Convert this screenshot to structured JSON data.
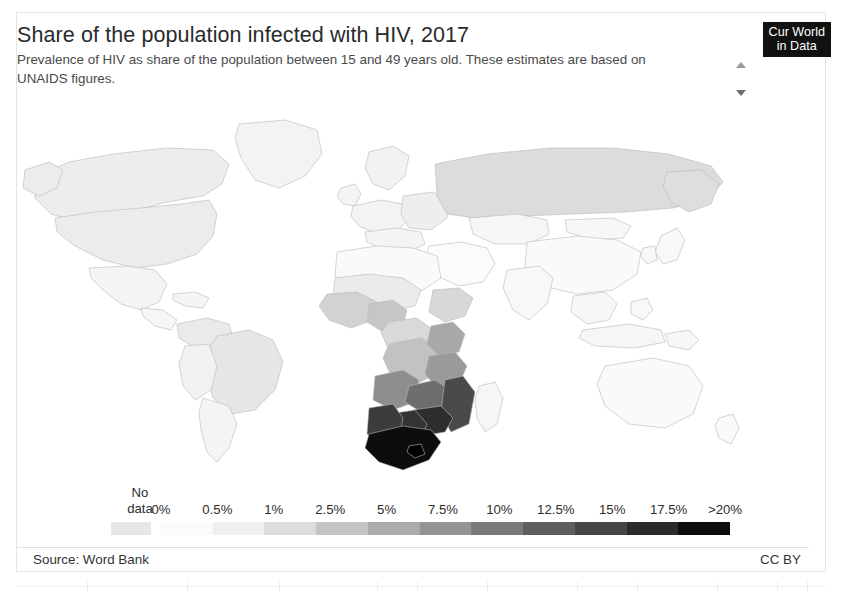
{
  "header": {
    "title": "Share of the population infected with HIV, 2017",
    "subtitle": "Prevalence of HIV as share of the population between 15 and 49 years old. These estimates are based on UNAIDS figures."
  },
  "logo": {
    "line1": "Cur World",
    "line2": "in Data"
  },
  "stepper": {
    "up_icon": "chevron-up-icon",
    "down_icon": "chevron-down-icon"
  },
  "legend": {
    "nodata_line1": "No",
    "nodata_line2": "data",
    "nodata_color": "#e6e6e6",
    "ticks": [
      "0%",
      "0.5%",
      "1%",
      "2.5%",
      "5%",
      "7.5%",
      "10%",
      "12.5%",
      "15%",
      "17.5%",
      ">20%"
    ]
  },
  "footer": {
    "source": "Source: Word Bank",
    "license": "CC BY"
  },
  "chart_data": {
    "type": "heatmap",
    "title": "Share of the population infected with HIV, 2017",
    "subtitle": "Prevalence of HIV as share of the population between 15 and 49 years old. These estimates are based on UNAIDS figures.",
    "xlabel": "",
    "ylabel": "",
    "unit": "% of population aged 15-49",
    "year": 2017,
    "legend_position": "bottom",
    "grid": false,
    "projection": "world-choropleth",
    "color_scale": {
      "type": "sequential-binned",
      "no_data_color": "#e6e6e6",
      "bins": [
        {
          "label": "0%",
          "value": 0,
          "color": "#fbfbfb"
        },
        {
          "label": "0.5%",
          "value": 0.5,
          "color": "#efefef"
        },
        {
          "label": "1%",
          "value": 1,
          "color": "#dcdcdc"
        },
        {
          "label": "2.5%",
          "value": 2.5,
          "color": "#c4c4c4"
        },
        {
          "label": "5%",
          "value": 5,
          "color": "#ababab"
        },
        {
          "label": "7.5%",
          "value": 7.5,
          "color": "#949494"
        },
        {
          "label": "10%",
          "value": 10,
          "color": "#7a7a7a"
        },
        {
          "label": "12.5%",
          "value": 12.5,
          "color": "#5e5e5e"
        },
        {
          "label": "15%",
          "value": 15,
          "color": "#464646"
        },
        {
          "label": "17.5%",
          "value": 17.5,
          "color": "#2b2b2b"
        },
        {
          "label": ">20%",
          "value": 20,
          "color": "#0d0d0d"
        }
      ]
    },
    "regions": [
      {
        "name": "Southern Africa (South Africa, Lesotho, Eswatini)",
        "value": 20,
        "color": "#0d0d0d"
      },
      {
        "name": "Botswana / Zimbabwe",
        "value": 17.5,
        "color": "#2b2b2b"
      },
      {
        "name": "Namibia / Mozambique / Zambia",
        "value": 12.5,
        "color": "#4f4f4f"
      },
      {
        "name": "Malawi / Tanzania / Uganda",
        "value": 7.5,
        "color": "#8e8e8e"
      },
      {
        "name": "Kenya / Central Africa",
        "value": 5,
        "color": "#a8a8a8"
      },
      {
        "name": "West Africa",
        "value": 1,
        "color": "#d0d0d0"
      },
      {
        "name": "North Africa / Middle East",
        "value": 0.1,
        "color": "#fafafa"
      },
      {
        "name": "Russia / Eastern Europe",
        "value": 1,
        "color": "#d8d8d8"
      },
      {
        "name": "Brazil / South America",
        "value": 0.5,
        "color": "#ececec"
      },
      {
        "name": "North America",
        "value": 0.5,
        "color": "#ededed"
      },
      {
        "name": "Western Europe",
        "value": 0.3,
        "color": "#f4f4f4"
      },
      {
        "name": "China / South Asia",
        "value": 0.1,
        "color": "#fcfcfc"
      },
      {
        "name": "Australia",
        "value": 0.1,
        "color": "#fcfcfc"
      }
    ]
  }
}
